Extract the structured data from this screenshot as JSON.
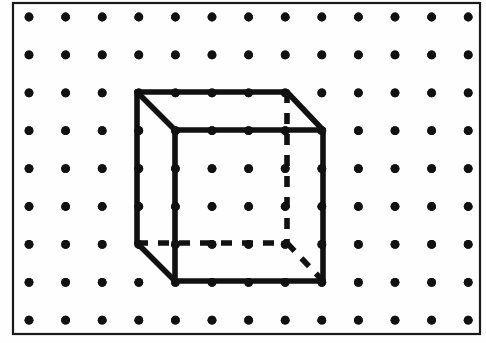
{
  "figure": {
    "canvas": {
      "width": 486,
      "height": 343,
      "background": "#fefefe"
    },
    "frame": {
      "name": "outer-border",
      "x": 13,
      "y": 3,
      "width": 467,
      "height": 331,
      "stroke": "#1a1a1a",
      "stroke_width": 2.2,
      "fill": "none"
    },
    "grid": {
      "name": "dot-grid",
      "columns": 13,
      "rows": 9,
      "origin_x": 29,
      "origin_y": 17,
      "step_x": 36.6,
      "step_y": 37.9,
      "dot_radius": 4.4,
      "dot_color": "#111111"
    },
    "cube": {
      "stroke": "#111111",
      "stroke_width": 5.6,
      "dash_pattern": "11 10",
      "vertices": {
        "front_top_left": {
          "x": 175,
          "y": 130
        },
        "front_top_right": {
          "x": 323,
          "y": 130
        },
        "front_bottom_left": {
          "x": 175,
          "y": 281
        },
        "front_bottom_right": {
          "x": 323,
          "y": 281
        },
        "back_top_left": {
          "x": 137,
          "y": 92
        },
        "back_top_right": {
          "x": 287,
          "y": 92
        },
        "back_bottom_left": {
          "x": 137,
          "y": 243
        },
        "back_bottom_right": {
          "x": 287,
          "y": 243
        }
      },
      "solid_edges": [
        {
          "name": "front-face-top",
          "from": "front_top_left",
          "to": "front_top_right"
        },
        {
          "name": "front-face-right",
          "from": "front_top_right",
          "to": "front_bottom_right"
        },
        {
          "name": "front-face-bottom",
          "from": "front_bottom_right",
          "to": "front_bottom_left"
        },
        {
          "name": "front-face-left",
          "from": "front_bottom_left",
          "to": "front_top_left"
        },
        {
          "name": "back-face-top",
          "from": "back_top_left",
          "to": "back_top_right"
        },
        {
          "name": "back-face-left",
          "from": "back_top_left",
          "to": "back_bottom_left"
        },
        {
          "name": "connector-top-left",
          "from": "back_top_left",
          "to": "front_top_left"
        },
        {
          "name": "connector-top-right",
          "from": "back_top_right",
          "to": "front_top_right"
        },
        {
          "name": "connector-bottom-left",
          "from": "back_bottom_left",
          "to": "front_bottom_left"
        }
      ],
      "hidden_edges": [
        {
          "name": "hidden-back-right-vertical",
          "from": "back_top_right",
          "to": "back_bottom_right"
        },
        {
          "name": "hidden-back-bottom",
          "from": "back_bottom_left",
          "to": "back_bottom_right"
        },
        {
          "name": "hidden-connector-bottom-right",
          "from": "back_bottom_right",
          "to": "front_bottom_right"
        }
      ]
    }
  }
}
